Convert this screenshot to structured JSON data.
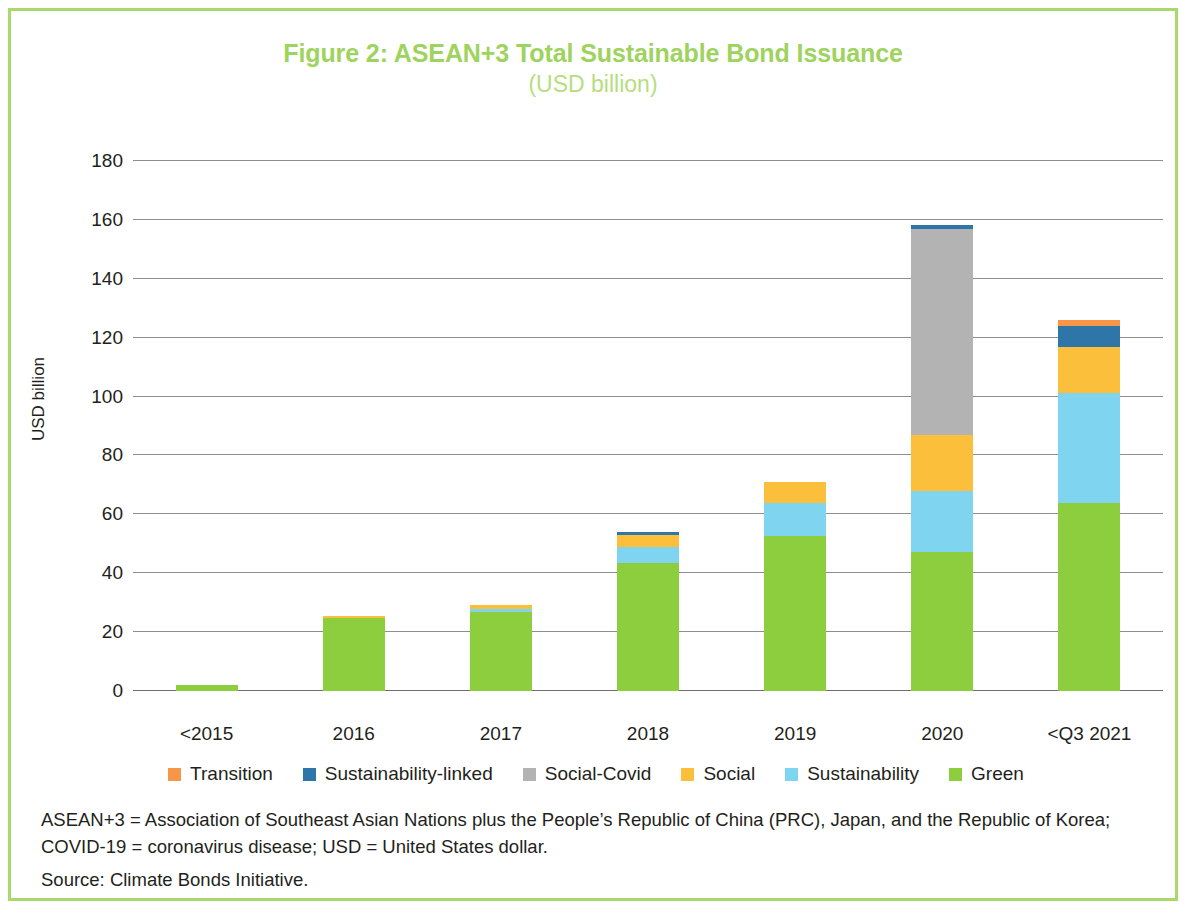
{
  "figure": {
    "title": "Figure 2: ASEAN+3 Total Sustainable Bond Issuance",
    "subtitle": "(USD billion)",
    "title_color": "#9ed35e",
    "border_color": "#a8d96a"
  },
  "notes": {
    "definition": "ASEAN+3 = Association of Southeast Asian Nations plus the People’s Republic of China (PRC), Japan, and the Republic of Korea; COVID-19 = coronavirus disease; USD = United States dollar.",
    "source": "Source: Climate Bonds Initiative."
  },
  "chart_data": {
    "type": "bar",
    "stacked": true,
    "title": "Figure 2: ASEAN+3 Total Sustainable Bond Issuance",
    "subtitle": "(USD billion)",
    "xlabel": "",
    "ylabel": "USD billion",
    "ylim": [
      0,
      180
    ],
    "yticks": [
      0,
      20,
      40,
      60,
      80,
      100,
      120,
      140,
      160,
      180
    ],
    "ytick_labels": [
      "0",
      "20",
      "40",
      "60",
      "80",
      "100",
      "120",
      "140",
      "160",
      "180"
    ],
    "grid": true,
    "legend_position": "bottom",
    "categories": [
      "<2015",
      "2016",
      "2017",
      "2018",
      "2019",
      "2020",
      "<Q3 2021"
    ],
    "series": [
      {
        "name": "Green",
        "color": "#8DCE3F",
        "values": [
          2.2,
          24.8,
          27.0,
          43.5,
          52.5,
          47.3,
          64.0
        ]
      },
      {
        "name": "Sustainability",
        "color": "#7FD4F0",
        "values": [
          0.0,
          0.0,
          1.0,
          5.5,
          11.5,
          20.7,
          37.2
        ]
      },
      {
        "name": "Social",
        "color": "#FBBF3C",
        "values": [
          0.0,
          0.3,
          1.3,
          4.0,
          7.0,
          19.0,
          15.8
        ]
      },
      {
        "name": "Social-Covid",
        "color": "#B3B3B3",
        "values": [
          0.0,
          0.0,
          0.0,
          0.0,
          0.0,
          70.0,
          0.0
        ]
      },
      {
        "name": "Sustainability-linked",
        "color": "#2E75A8",
        "values": [
          0.0,
          0.0,
          0.0,
          0.9,
          0.0,
          1.4,
          7.0
        ]
      },
      {
        "name": "Transition",
        "color": "#F79646",
        "values": [
          0.0,
          0.0,
          0.0,
          0.0,
          0.0,
          0.0,
          2.0
        ]
      }
    ],
    "totals": [
      2.2,
      25.1,
      29.3,
      53.9,
      71.0,
      158.4,
      126.0
    ]
  },
  "legend": {
    "items": [
      {
        "label": "Transition",
        "color": "#F79646"
      },
      {
        "label": "Sustainability-linked",
        "color": "#2E75A8"
      },
      {
        "label": "Social-Covid",
        "color": "#B3B3B3"
      },
      {
        "label": "Social",
        "color": "#FBBF3C"
      },
      {
        "label": "Sustainability",
        "color": "#7FD4F0"
      },
      {
        "label": "Green",
        "color": "#8DCE3F"
      }
    ]
  }
}
